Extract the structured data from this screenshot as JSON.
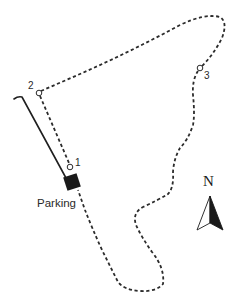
{
  "map": {
    "type": "trail-map",
    "colors": {
      "background": "#ffffff",
      "trail": "#2b2b2b",
      "road": "#1f1f1f",
      "parking": "#1a1a1a",
      "text": "#2a2a2a"
    },
    "parking": {
      "label": "Parking"
    },
    "waypoints": [
      {
        "id": "1",
        "label": "1"
      },
      {
        "id": "2",
        "label": "2"
      },
      {
        "id": "3",
        "label": "3"
      }
    ],
    "north_arrow": {
      "label": "N"
    },
    "legend": {
      "trail_style": "dashed",
      "road_style": "solid"
    }
  }
}
